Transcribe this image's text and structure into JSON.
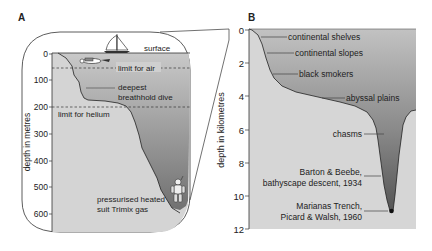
{
  "panel_a": {
    "label": "A",
    "y_axis_label": "depth in metres",
    "ticks": [
      "0",
      "100",
      "200",
      "300",
      "400",
      "500",
      "600"
    ],
    "annotations": {
      "surface": "surface",
      "limit_air": "limit for air",
      "breathhold_1": "deepest",
      "breathhold_2": "breathhold dive",
      "limit_helium": "limit for helium",
      "suit_1": "pressurised heated",
      "suit_2": "suit Trimix gas"
    },
    "icons": [
      "sailboat-icon",
      "swimming-diver-icon",
      "atmospheric-diving-suit-icon"
    ]
  },
  "panel_b": {
    "label": "B",
    "y_axis_label": "depth in kilometres",
    "ticks": [
      "0",
      "2",
      "4",
      "6",
      "8",
      "10",
      "12"
    ],
    "annotations": {
      "shelves": "continental shelves",
      "slopes": "continental slopes",
      "smokers": "black smokers",
      "abyssal": "abyssal plains",
      "chasms": "chasms",
      "barton_1": "Barton & Beebe,",
      "barton_2": "bathyscape descent, 1934",
      "marianas_1": "Marianas Trench,",
      "marianas_2": "Picard & Walsh, 1960"
    }
  },
  "colors": {
    "light_fill": "#d6d6d6",
    "water_top": "#c4c4c4",
    "water_bottom": "#6a6a6a",
    "line": "#222222"
  }
}
